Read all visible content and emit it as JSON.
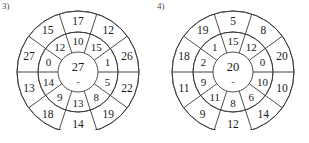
{
  "page": {
    "background_color": "#ffffff",
    "ink_color": "#1a1a1a",
    "stroke_color": "#3b3b3b",
    "axis_color": "#9a9a9a"
  },
  "puzzles": [
    {
      "id": "puzzle-3",
      "label": "3)",
      "center": {
        "value": "27",
        "operator": "-"
      },
      "middle_ring": [
        "10",
        "15",
        "1",
        "5",
        "8",
        "13",
        "9",
        "14",
        "0",
        "12"
      ],
      "outer_ring": [
        "17",
        "12",
        "26",
        "22",
        "19",
        "14",
        "18",
        "13",
        "27",
        "15"
      ]
    },
    {
      "id": "puzzle-4",
      "label": "4)",
      "center": {
        "value": "20",
        "operator": "-"
      },
      "middle_ring": [
        "15",
        "12",
        "0",
        "10",
        "6",
        "8",
        "11",
        "9",
        "2",
        "1"
      ],
      "outer_ring": [
        "5",
        "8",
        "20",
        "10",
        "14",
        "12",
        "9",
        "11",
        "18",
        "19"
      ]
    }
  ],
  "geometry": {
    "sectors": 10,
    "center_radius": 20,
    "middle_radius": 40,
    "outer_radius": 61,
    "cx": 62,
    "cy": 66,
    "svg_size": 124
  }
}
